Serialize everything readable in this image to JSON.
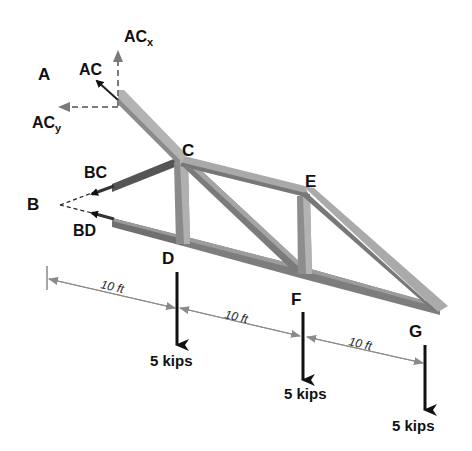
{
  "figure": {
    "type": "truss free-body diagram",
    "colors": {
      "member_fill": "#a9a9a9",
      "member_dark": "#6e6e6e",
      "member_shadow": "#555555",
      "arrow": "#111111",
      "component_arrow": "#7a7a7a",
      "dimension": "#808080",
      "text": "#111111"
    }
  },
  "nodes": {
    "A": "A",
    "B": "B",
    "C": "C",
    "D": "D",
    "E": "E",
    "F": "F",
    "G": "G"
  },
  "forces": {
    "AC": "AC",
    "ACx_main": "AC",
    "ACx_sub": "x",
    "ACy_main": "AC",
    "ACy_sub": "y",
    "BC": "BC",
    "BD": "BD"
  },
  "loads": [
    {
      "node": "D",
      "label": "5 kips"
    },
    {
      "node": "F",
      "label": "5 kips"
    },
    {
      "node": "G",
      "label": "5 kips"
    }
  ],
  "dimensions": [
    {
      "label": "10 ft"
    },
    {
      "label": "10 ft"
    },
    {
      "label": "10 ft"
    }
  ]
}
